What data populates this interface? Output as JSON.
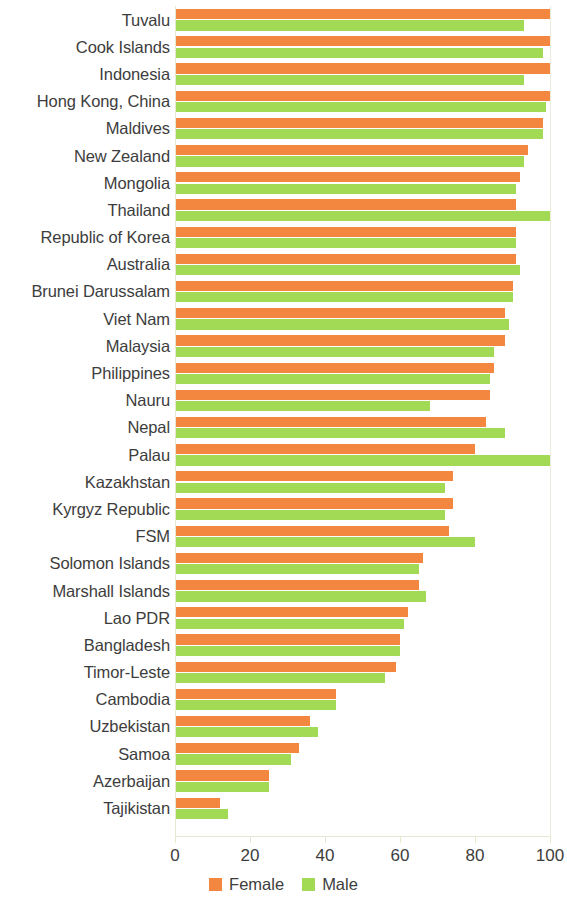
{
  "chart_data": {
    "type": "bar",
    "orientation": "horizontal",
    "title": "",
    "subtitle": "",
    "xlabel": "",
    "ylabel": "",
    "xlim": [
      0,
      100
    ],
    "xticks": [
      0,
      20,
      40,
      60,
      80,
      100
    ],
    "xtick_labels": [
      "0",
      "20",
      "40",
      "60",
      "80",
      "100"
    ],
    "grid": false,
    "legend_position": "bottom-center",
    "categories": [
      "Tuvalu",
      "Cook Islands",
      "Indonesia",
      "Hong Kong, China",
      "Maldives",
      "New Zealand",
      "Mongolia",
      "Thailand",
      "Republic of Korea",
      "Australia",
      "Brunei Darussalam",
      "Viet Nam",
      "Malaysia",
      "Philippines",
      "Nauru",
      "Nepal",
      "Palau",
      "Kazakhstan",
      "Kyrgyz Republic",
      "FSM",
      "Solomon Islands",
      "Marshall Islands",
      "Lao PDR",
      "Bangladesh",
      "Timor-Leste",
      "Cambodia",
      "Uzbekistan",
      "Samoa",
      "Azerbaijan",
      "Tajikistan"
    ],
    "series": [
      {
        "name": "Female",
        "color": "#f4873f",
        "values": [
          100,
          100,
          100,
          100,
          98,
          94,
          92,
          91,
          91,
          91,
          90,
          88,
          88,
          85,
          84,
          83,
          80,
          74,
          74,
          73,
          66,
          65,
          62,
          60,
          59,
          43,
          36,
          33,
          25,
          12
        ]
      },
      {
        "name": "Male",
        "color": "#a3da55",
        "values": [
          93,
          98,
          93,
          99,
          98,
          93,
          91,
          100,
          91,
          92,
          90,
          89,
          85,
          84,
          68,
          88,
          100,
          72,
          72,
          80,
          65,
          67,
          61,
          60,
          56,
          43,
          38,
          31,
          25,
          14
        ]
      }
    ]
  },
  "legend": {
    "items": [
      {
        "label": "Female",
        "key": "female"
      },
      {
        "label": "Male",
        "key": "male"
      }
    ]
  },
  "colors": {
    "female": "#f4873f",
    "male": "#a3da55",
    "axis": "#e6e8cf",
    "text": "#3d3d3d",
    "background": "#ffffff"
  }
}
